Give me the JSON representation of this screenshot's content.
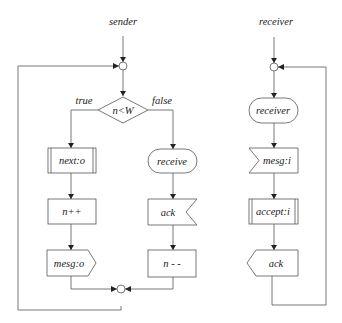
{
  "sender": {
    "title": "sender",
    "decision": {
      "label": "n<W",
      "true_label": "true",
      "false_label": "false"
    },
    "true_branch": [
      {
        "shape": "procedure",
        "label": "next:o"
      },
      {
        "shape": "process",
        "label": "n++"
      },
      {
        "shape": "send-signal",
        "label": "mesg:o"
      }
    ],
    "false_branch": [
      {
        "shape": "terminator",
        "label": "receive"
      },
      {
        "shape": "receive-signal",
        "label": "ack"
      },
      {
        "shape": "process",
        "label": "n - -"
      }
    ]
  },
  "receiver": {
    "title": "receiver",
    "steps": [
      {
        "shape": "terminator",
        "label": "receiver"
      },
      {
        "shape": "receive-signal",
        "label": "mesg:i"
      },
      {
        "shape": "procedure",
        "label": "accept:i"
      },
      {
        "shape": "send-signal",
        "label": "ack"
      }
    ]
  },
  "colors": {
    "line": "#555555",
    "text": "#222222",
    "background": "#ffffff"
  }
}
